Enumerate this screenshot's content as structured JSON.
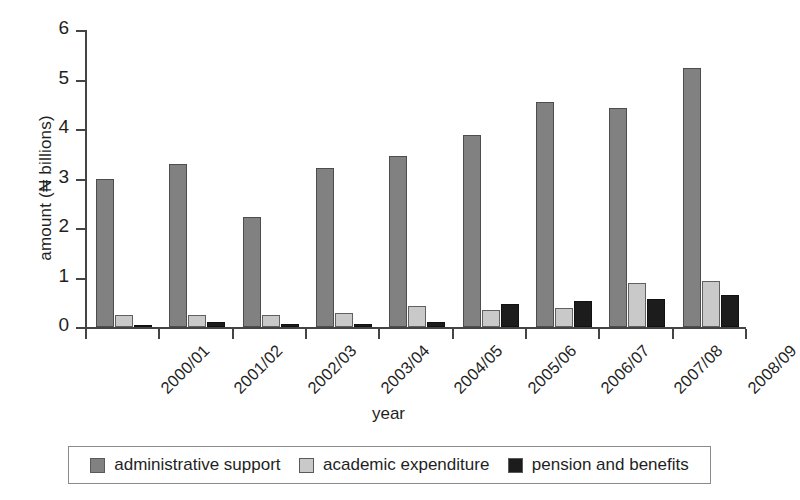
{
  "chart_data": {
    "type": "bar",
    "title": "",
    "xlabel": "year",
    "ylabel": "amount (₦ billions)",
    "categories": [
      "2000/01",
      "2001/02",
      "2002/03",
      "2003/04",
      "2004/05",
      "2005/06",
      "2006/07",
      "2007/08",
      "2008/09"
    ],
    "series": [
      {
        "name": "administrative support",
        "color": "#818181",
        "values": [
          3.0,
          3.3,
          2.23,
          3.22,
          3.45,
          3.87,
          4.54,
          4.42,
          5.23
        ]
      },
      {
        "name": "academic expenditure",
        "color": "#c9c9c9",
        "values": [
          0.25,
          0.24,
          0.25,
          0.29,
          0.42,
          0.35,
          0.39,
          0.89,
          0.93
        ]
      },
      {
        "name": "pension and benefits",
        "color": "#1c1c1c",
        "values": [
          0.03,
          0.1,
          0.06,
          0.06,
          0.1,
          0.47,
          0.53,
          0.57,
          0.65
        ]
      }
    ],
    "ylim": [
      0,
      6
    ],
    "yticks": [
      0,
      1,
      2,
      3,
      4,
      5,
      6
    ],
    "ytick_labels": [
      "0",
      "1",
      "2",
      "3",
      "4",
      "5",
      "6"
    ],
    "grid": false,
    "legend_position": "bottom"
  },
  "axes": {
    "y_title": "amount (₦ billions)",
    "x_title": "year"
  },
  "legend": {
    "items": [
      {
        "label": "administrative support",
        "color": "#818181"
      },
      {
        "label": "academic expenditure",
        "color": "#c9c9c9"
      },
      {
        "label": "pension and benefits",
        "color": "#1c1c1c"
      }
    ]
  }
}
